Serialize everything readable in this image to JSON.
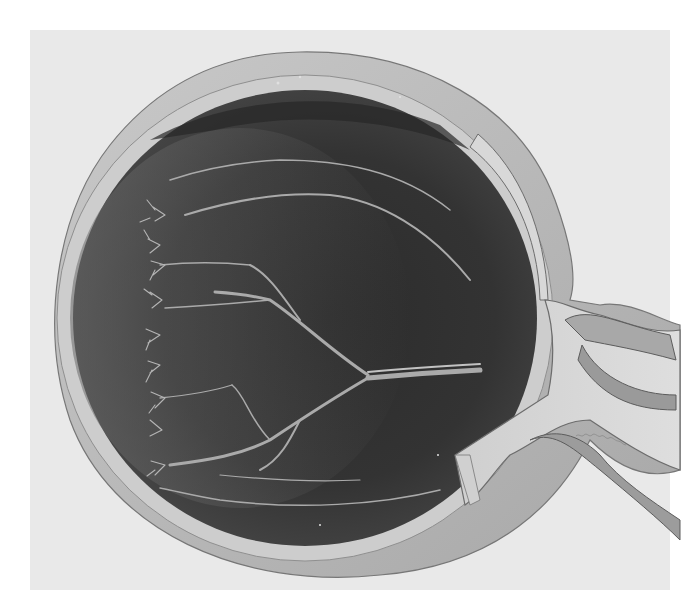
{
  "figure": {
    "style": "grayscale-illustration",
    "colors": {
      "page_background": "#ffffff",
      "figure_background": "#e9e9e9",
      "sclera": "#bdbdbd",
      "sclera_shadow": "#9a9a9a",
      "choroid_band": "#cfcfcf",
      "fundus_dark": "#2e2e2e",
      "fundus_mid": "#3b3b3b",
      "fundus_light_periphery": "#5a5a5a",
      "vessel": "#a9a9a9",
      "optic_nerve": "#d6d6d6",
      "nerve_sheath": "#8a8a8a"
    }
  }
}
